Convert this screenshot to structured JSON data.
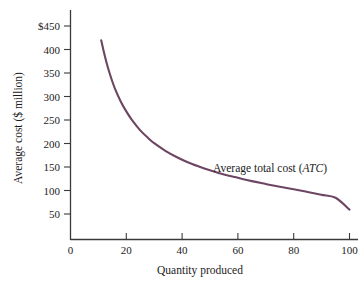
{
  "chart_data": {
    "type": "line",
    "title": "",
    "subtitle": "",
    "xlabel": "Quantity produced",
    "ylabel": "Average cost ($ million)",
    "xlim": [
      0,
      110
    ],
    "ylim": [
      0,
      470
    ],
    "grid": false,
    "legend_position": "inline-annotation",
    "x_ticks": [
      0,
      20,
      40,
      60,
      80,
      100
    ],
    "x_tick_labels": [
      "0",
      "20",
      "40",
      "60",
      "80",
      "100"
    ],
    "y_ticks": [
      50,
      100,
      150,
      200,
      250,
      300,
      350,
      400,
      450
    ],
    "y_tick_labels": [
      "50",
      "100",
      "150",
      "200",
      "250",
      "300",
      "350",
      "400",
      "$450"
    ],
    "series": [
      {
        "name": "Average total cost (ATC)",
        "annotation": "Average total cost (ATC)",
        "annotation_plain": "Average total cost",
        "annotation_italic": "ATC",
        "color": "#6d4663",
        "x": [
          11,
          12,
          13,
          14,
          15,
          16,
          18,
          20,
          22,
          25,
          28,
          30,
          34,
          38,
          42,
          46,
          50,
          55,
          60,
          65,
          70,
          75,
          80,
          85,
          90,
          95,
          100
        ],
        "values": [
          420,
          394,
          371,
          351,
          333,
          317,
          291,
          270,
          252,
          230,
          213,
          203,
          187,
          174,
          163,
          154,
          146,
          137,
          130,
          123,
          117,
          111,
          106,
          100,
          94,
          88,
          63
        ]
      }
    ]
  },
  "axis": {
    "y_axis_name": "y-axis",
    "x_axis_name": "x-axis",
    "axis_color": "#3a3a3a"
  },
  "colors": {
    "curve": "#6d4663",
    "axis": "#3a3a3a",
    "text": "#1b1b1b",
    "background": "#ffffff"
  }
}
